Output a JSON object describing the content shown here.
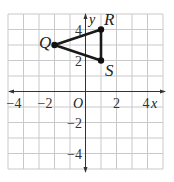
{
  "figure": {
    "type": "coordinate-plane",
    "x_axis_label": "x",
    "y_axis_label": "y",
    "origin_label": "O",
    "x_range": [
      -5,
      5
    ],
    "y_range": [
      -5,
      5
    ],
    "x_ticks": [
      {
        "value": -4,
        "label": "−4"
      },
      {
        "value": -2,
        "label": "−2"
      },
      {
        "value": 2,
        "label": "2"
      },
      {
        "value": 4,
        "label": "4"
      }
    ],
    "y_ticks": [
      {
        "value": 4,
        "label": "4"
      },
      {
        "value": 2,
        "label": "2"
      },
      {
        "value": -2,
        "label": "−2"
      },
      {
        "value": -4,
        "label": "−4"
      }
    ],
    "points": [
      {
        "name": "Q",
        "x": -2,
        "y": 3
      },
      {
        "name": "R",
        "x": 1,
        "y": 4
      },
      {
        "name": "S",
        "x": 1,
        "y": 2
      }
    ],
    "polygon": [
      "Q",
      "R",
      "S"
    ],
    "colors": {
      "grid": "#c9c9c9",
      "axis": "#333333",
      "shape": "#1a1a1a"
    }
  }
}
